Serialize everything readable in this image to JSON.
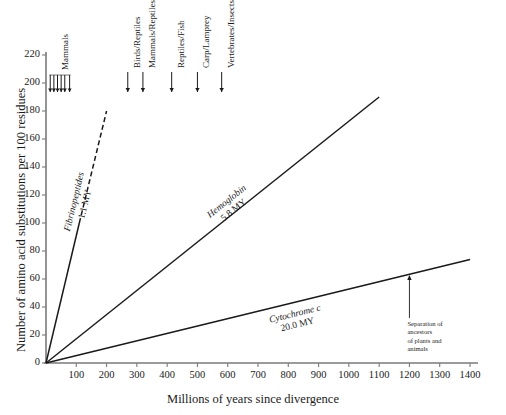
{
  "chart_data": {
    "type": "line",
    "title": "",
    "xlabel": "Millions of years since divergence",
    "ylabel": "Number of amino acid substitutions per 100 residues",
    "xlim": [
      0,
      1400
    ],
    "ylim": [
      0,
      220
    ],
    "xticks": [
      100,
      200,
      300,
      400,
      500,
      600,
      700,
      800,
      900,
      1000,
      1100,
      1200,
      1300,
      1400
    ],
    "yticks": [
      0,
      20,
      40,
      60,
      80,
      100,
      120,
      140,
      160,
      180,
      200,
      220
    ],
    "grid": false,
    "legend": "none (inline curve labels)",
    "series": [
      {
        "name": "Fibrinopeptides",
        "rate_label": "1.1 MY",
        "style": "solid-then-dashed",
        "slope_subs_per_my": 0.909,
        "points": [
          [
            0,
            0
          ],
          [
            110,
            100
          ],
          [
            200,
            180
          ]
        ],
        "solid_segment": [
          [
            0,
            0
          ],
          [
            110,
            100
          ]
        ],
        "dashed_segment": [
          [
            110,
            100
          ],
          [
            200,
            180
          ]
        ]
      },
      {
        "name": "Hemoglobin",
        "rate_label": "5.8 MY",
        "style": "solid",
        "slope_subs_per_my": 0.172,
        "points": [
          [
            0,
            0
          ],
          [
            1100,
            190
          ]
        ]
      },
      {
        "name": "Cytochrome c",
        "rate_label": "20.0 MY",
        "style": "solid",
        "slope_subs_per_my": 0.0529,
        "points": [
          [
            0,
            0
          ],
          [
            1400,
            74
          ]
        ]
      }
    ],
    "divergence_markers": [
      {
        "label": "Mammals",
        "x": 75,
        "ticks_x": [
          14,
          26,
          38,
          50,
          62,
          78
        ],
        "bracket": true
      },
      {
        "label": "Birds/Reptiles",
        "x": 270,
        "bracket": false
      },
      {
        "label": "Mammals/Reptiles",
        "x": 320,
        "bracket": false
      },
      {
        "label": "Reptiles/Fish",
        "x": 415,
        "bracket": false
      },
      {
        "label": "Carp/Lamprey",
        "x": 500,
        "bracket": false
      },
      {
        "label": "Vertebrates/Insects",
        "x": 580,
        "bracket": false
      }
    ],
    "annotations": [
      {
        "text": "Separation of ancestors of plants and animals",
        "lines": [
          "Separation of",
          "ancestors",
          "of plants and",
          "animals"
        ],
        "points_to_x": 1200,
        "points_to_y": 65,
        "arrow": "up"
      }
    ],
    "colors": {
      "axis": "#7a7a7a",
      "line": "#1a1a1a",
      "text": "#1a1a1a",
      "background": "#ffffff"
    }
  }
}
